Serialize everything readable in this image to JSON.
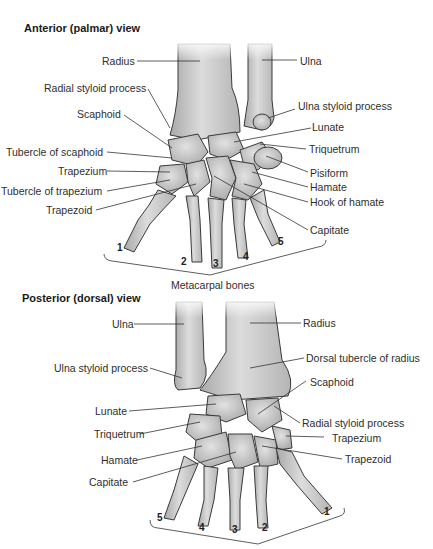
{
  "anterior": {
    "title": "Anterior (palmar) view",
    "labels": {
      "radius": "Radius",
      "ulna": "Ulna",
      "radial_styloid": "Radial styloid process",
      "ulna_styloid": "Ulna styloid process",
      "scaphoid": "Scaphoid",
      "lunate": "Lunate",
      "tubercle_scaphoid": "Tubercle of scaphoid",
      "triquetrum": "Triquetrum",
      "trapezium": "Trapezium",
      "pisiform": "Pisiform",
      "tubercle_trapezium": "Tubercle of trapezium",
      "hamate": "Hamate",
      "trapezoid": "Trapezoid",
      "hook_hamate": "Hook of hamate",
      "capitate": "Capitate",
      "metacarpal_bones": "Metacarpal bones"
    },
    "metacarpal_numbers": [
      "1",
      "2",
      "3",
      "4",
      "5"
    ]
  },
  "posterior": {
    "title": "Posterior (dorsal) view",
    "labels": {
      "ulna": "Ulna",
      "radius": "Radius",
      "dorsal_tubercle": "Dorsal tubercle of radius",
      "ulna_styloid": "Ulna styloid process",
      "scaphoid": "Scaphoid",
      "lunate": "Lunate",
      "radial_styloid": "Radial styloid process",
      "triquetrum": "Triquetrum",
      "trapezium": "Trapezium",
      "hamate": "Hamate",
      "trapezoid": "Trapezoid",
      "capitate": "Capitate"
    },
    "metacarpal_numbers": [
      "5",
      "4",
      "3",
      "2",
      "1"
    ]
  }
}
